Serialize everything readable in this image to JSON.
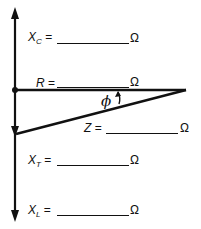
{
  "diagram": {
    "fields": {
      "xc": {
        "symbol": "X",
        "subscript": "C",
        "equals": "=",
        "value": "",
        "unit": "Ω"
      },
      "r": {
        "symbol": "R",
        "subscript": "",
        "equals": "=",
        "value": "",
        "unit": "Ω"
      },
      "z": {
        "symbol": "Z",
        "subscript": "",
        "equals": "=",
        "value": "",
        "unit": "Ω"
      },
      "xt": {
        "symbol": "X",
        "subscript": "T",
        "equals": "=",
        "value": "",
        "unit": "Ω"
      },
      "xl": {
        "symbol": "X",
        "subscript": "L",
        "equals": "=",
        "value": "",
        "unit": "Ω"
      }
    },
    "angle_label": "ϕ",
    "colors": {
      "ink": "#111111",
      "background": "#ffffff"
    }
  }
}
